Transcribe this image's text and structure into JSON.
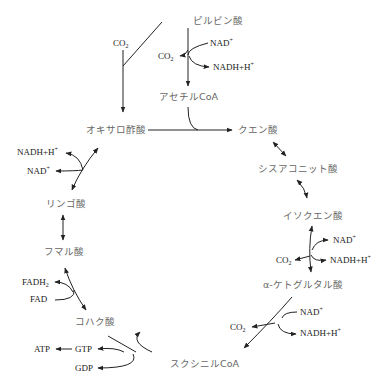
{
  "compounds": {
    "pyruvate": "ピルビン酸",
    "acetyl_coa": "アセチルCoA",
    "oxaloacetate": "オキサロ酢酸",
    "citrate": "クエン酸",
    "cis_aconitate": "シスアコニット酸",
    "isocitrate": "イソクエン酸",
    "alpha_ketoglutarate": "α-ケトグルタル酸",
    "succinyl_coa": "スクシニルCoA",
    "succinate": "コハク酸",
    "fumarate": "フマル酸",
    "malate": "リンゴ酸"
  },
  "cofactors": {
    "co2": "CO",
    "co2_sub": "2",
    "nad": "NAD",
    "nad_sup": "+",
    "nadh": "NADH+H",
    "nadh_sup": "+",
    "fadh2": "FADH",
    "fadh2_sub": "2",
    "fad": "FAD",
    "atp": "ATP",
    "gtp": "GTP",
    "gdp": "GDP"
  },
  "colors": {
    "line": "#222222",
    "compound_text": "#666666",
    "cofactor_text": "#222222"
  }
}
